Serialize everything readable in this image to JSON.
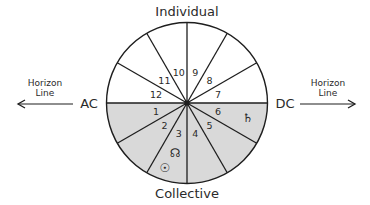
{
  "diagram": {
    "title_top": "Individual",
    "title_bottom": "Collective",
    "ascendant_label": "AC",
    "descendant_label": "DC",
    "horizon_left": {
      "line1": "Horizon",
      "line2": "Line"
    },
    "horizon_right": {
      "line1": "Horizon",
      "line2": "Line"
    },
    "houses": [
      {
        "number": "1",
        "hemisphere": "below"
      },
      {
        "number": "2",
        "hemisphere": "below"
      },
      {
        "number": "3",
        "hemisphere": "below"
      },
      {
        "number": "4",
        "hemisphere": "below"
      },
      {
        "number": "5",
        "hemisphere": "below"
      },
      {
        "number": "6",
        "hemisphere": "below"
      },
      {
        "number": "7",
        "hemisphere": "above"
      },
      {
        "number": "8",
        "hemisphere": "above"
      },
      {
        "number": "9",
        "hemisphere": "above"
      },
      {
        "number": "10",
        "hemisphere": "above"
      },
      {
        "number": "11",
        "hemisphere": "above"
      },
      {
        "number": "12",
        "hemisphere": "above"
      }
    ],
    "placements": [
      {
        "body": "north-node",
        "glyph": "☊",
        "house": "3"
      },
      {
        "body": "sun",
        "glyph": "☉",
        "house": "3"
      },
      {
        "body": "saturn",
        "glyph": "♄",
        "house": "6"
      }
    ],
    "colors": {
      "below_horizon_fill": "#d9d9d9",
      "above_horizon_fill": "#ffffff",
      "line": "#1e1e1e"
    }
  }
}
